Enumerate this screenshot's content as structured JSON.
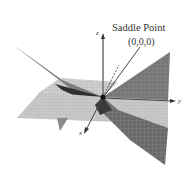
{
  "figure": {
    "type": "3d-surface-diagram",
    "annotation": {
      "title": "Saddle Point",
      "coordinates": "(0,0,0)"
    },
    "axes": {
      "x": "x",
      "y": "y",
      "z": "z"
    },
    "colors": {
      "surface_dark": "#6e6e6e",
      "surface_shadow": "#2a2a2a",
      "plane": "#c8c8c8",
      "grid": "#9a9a9a",
      "axis": "#333333",
      "point": "#111111"
    }
  }
}
